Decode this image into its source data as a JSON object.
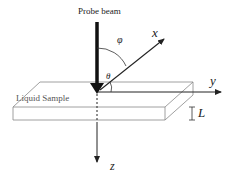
{
  "diagram": {
    "beam_label": "Probe beam",
    "sample_label": "Liquid Sample",
    "axes": {
      "x": "x",
      "y": "y",
      "z": "z"
    },
    "angles": {
      "phi": "φ",
      "theta": "θ"
    },
    "thickness_label": "L",
    "colors": {
      "line": "#222222",
      "slab": "#888888",
      "background": "#ffffff"
    }
  }
}
